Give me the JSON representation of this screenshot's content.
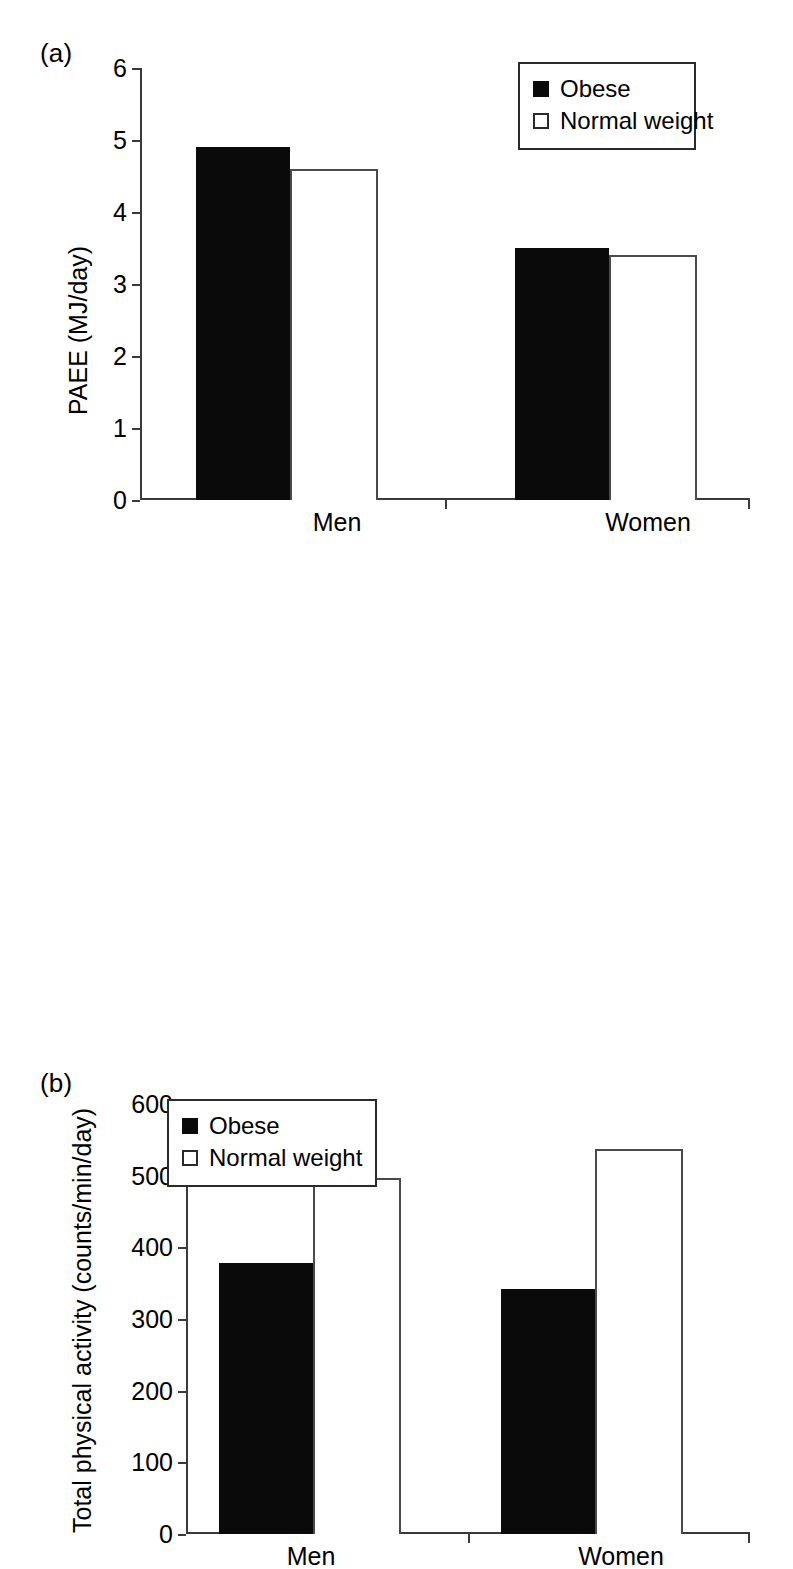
{
  "figure": {
    "panels": [
      {
        "label": "(a)",
        "legend": [
          {
            "key": "obese",
            "text": "Obese",
            "marker": "filled-square-icon"
          },
          {
            "key": "normal",
            "text": "Normal weight",
            "marker": "open-square-icon"
          }
        ]
      },
      {
        "label": "(b)",
        "legend": [
          {
            "key": "obese",
            "text": "Obese",
            "marker": "filled-square-icon"
          },
          {
            "key": "normal",
            "text": "Normal weight",
            "marker": "open-square-icon"
          }
        ]
      }
    ]
  },
  "chart_data": [
    {
      "type": "bar",
      "panel": "(a)",
      "title": "",
      "xlabel": "",
      "ylabel": "PAEE (MJ/day)",
      "categories": [
        "Men",
        "Women"
      ],
      "series": [
        {
          "name": "Obese",
          "values": [
            4.9,
            3.5
          ],
          "color": "#000000"
        },
        {
          "name": "Normal weight",
          "values": [
            4.6,
            3.4
          ],
          "color": "#ffffff"
        }
      ],
      "ylim": [
        0,
        6
      ],
      "yticks": [
        0,
        1,
        2,
        3,
        4,
        5,
        6
      ],
      "ytick_labels": [
        "0",
        "1",
        "2",
        "3",
        "4",
        "5",
        "6"
      ],
      "grid": false,
      "legend_position": "top-right"
    },
    {
      "type": "bar",
      "panel": "(b)",
      "title": "",
      "xlabel": "",
      "ylabel": "Total physical activity (counts/min/day)",
      "categories": [
        "Men",
        "Women"
      ],
      "series": [
        {
          "name": "Obese",
          "values": [
            378,
            342
          ],
          "color": "#000000"
        },
        {
          "name": "Normal weight",
          "values": [
            497,
            537
          ],
          "color": "#ffffff"
        }
      ],
      "ylim": [
        0,
        600
      ],
      "yticks": [
        0,
        100,
        200,
        300,
        400,
        500,
        600
      ],
      "ytick_labels": [
        "0",
        "100",
        "200",
        "300",
        "400",
        "500",
        "600"
      ],
      "grid": false,
      "legend_position": "top-left"
    }
  ]
}
